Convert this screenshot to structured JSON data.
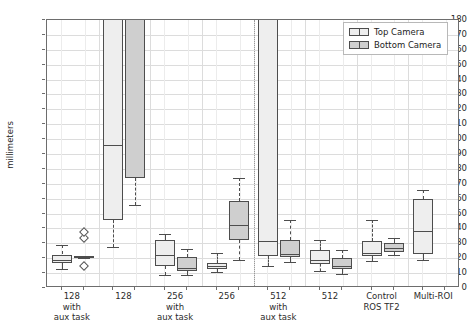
{
  "chart_data": {
    "type": "box",
    "title": "",
    "xlabel": "",
    "ylabel": "millimeters",
    "ylim": [
      0,
      180
    ],
    "ytick_step": 10,
    "grid": true,
    "legend_position": "upper right",
    "yticks": [
      0,
      10,
      20,
      30,
      40,
      50,
      60,
      70,
      80,
      90,
      100,
      110,
      120,
      130,
      140,
      150,
      160,
      170,
      180
    ],
    "categories": [
      "128\nwith\naux task",
      "128",
      "256\nwith\naux task",
      "256",
      "512\nwith\naux task",
      "512",
      "Control\nROS TF2",
      "Multi-ROI"
    ],
    "series": [
      {
        "name": "Top Camera",
        "color": "#eeeeee",
        "boxes": [
          {
            "category": "128 with aux task",
            "whisker_low": 12.5,
            "q1": 17.0,
            "median": 19.0,
            "q3": 22.5,
            "whisker_high": 29.0,
            "fliers": []
          },
          {
            "category": "128",
            "whisker_low": 27.5,
            "q1": 45.5,
            "median": 96.0,
            "q3": 195.0,
            "whisker_high": 195.0,
            "fliers": []
          },
          {
            "category": "256 with aux task",
            "whisker_low": 9.0,
            "q1": 15.0,
            "median": 22.0,
            "q3": 32.0,
            "whisker_high": 36.5,
            "fliers": []
          },
          {
            "category": "256",
            "whisker_low": 11.0,
            "q1": 13.0,
            "median": 14.5,
            "q3": 17.0,
            "whisker_high": 23.5,
            "fliers": []
          },
          {
            "category": "512 with aux task",
            "whisker_low": 14.5,
            "q1": 21.5,
            "median": 31.5,
            "q3": 195.0,
            "whisker_high": 195.0,
            "fliers": []
          },
          {
            "category": "512",
            "whisker_low": 11.5,
            "q1": 16.0,
            "median": 19.0,
            "q3": 25.5,
            "whisker_high": 32.5,
            "fliers": []
          },
          {
            "category": "Control ROS TF2",
            "whisker_low": 18.0,
            "q1": 21.5,
            "median": 23.5,
            "q3": 31.5,
            "whisker_high": 45.5,
            "fliers": []
          },
          {
            "category": "Multi-ROI",
            "whisker_low": 18.5,
            "q1": 23.0,
            "median": 38.5,
            "q3": 60.0,
            "whisker_high": 66.0,
            "fliers": []
          }
        ]
      },
      {
        "name": "Bottom Camera",
        "color": "#cfcfcf",
        "boxes": [
          {
            "category": "128 with aux task",
            "whisker_low": 20.0,
            "q1": 20.2,
            "median": 20.6,
            "q3": 21.2,
            "whisker_high": 21.5,
            "fliers": [
              15.0,
              33.5,
              37.5
            ]
          },
          {
            "category": "128",
            "whisker_low": 55.5,
            "q1": 74.0,
            "median": 195.0,
            "q3": 195.0,
            "whisker_high": 195.0,
            "fliers": []
          },
          {
            "category": "256 with aux task",
            "whisker_low": 9.0,
            "q1": 11.5,
            "median": 13.5,
            "q3": 21.0,
            "whisker_high": 26.5,
            "fliers": []
          },
          {
            "category": "256",
            "whisker_low": 18.5,
            "q1": 32.5,
            "median": 42.5,
            "q3": 58.5,
            "whisker_high": 74.0,
            "fliers": []
          },
          {
            "category": "512 with aux task",
            "whisker_low": 17.5,
            "q1": 20.5,
            "median": 23.0,
            "q3": 32.0,
            "whisker_high": 45.5,
            "fliers": []
          },
          {
            "category": "512",
            "whisker_low": 9.5,
            "q1": 12.5,
            "median": 15.0,
            "q3": 20.0,
            "whisker_high": 25.5,
            "fliers": []
          },
          {
            "category": "Control ROS TF2",
            "whisker_low": 22.0,
            "q1": 24.5,
            "median": 27.0,
            "q3": 30.0,
            "whisker_high": 33.5,
            "fliers": []
          },
          {
            "category": "512-none",
            "whisker_low": null,
            "q1": null,
            "median": null,
            "q3": null,
            "whisker_high": null,
            "fliers": []
          }
        ]
      }
    ],
    "legend": [
      {
        "label": "Top Camera",
        "swatch": "top-cam"
      },
      {
        "label": "Bottom Camera",
        "swatch": "bottom-cam"
      }
    ]
  }
}
